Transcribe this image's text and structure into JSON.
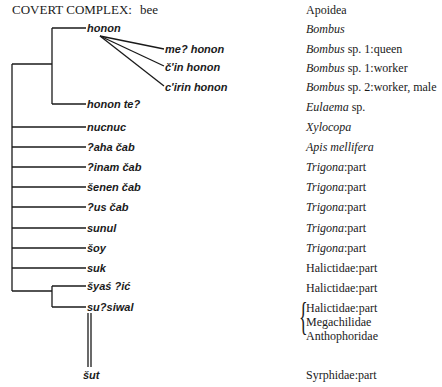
{
  "title": {
    "label": "COVERT COMPLEX:",
    "value": "bee",
    "right": "Apoidea"
  },
  "terms": [
    {
      "id": "honon",
      "label": "honon",
      "gloss_italic": "Bombus",
      "gloss": ""
    },
    {
      "id": "me-honon",
      "label": "me? honon",
      "gloss_italic": "Bombus",
      "gloss": " sp. 1:queen"
    },
    {
      "id": "cin-honon",
      "label": "č'in honon",
      "gloss_italic": "Bombus",
      "gloss": " sp. 1:worker"
    },
    {
      "id": "cirin-honon",
      "label": "c'irin honon",
      "gloss_italic": "Bombus",
      "gloss": " sp. 2:worker, male"
    },
    {
      "id": "honon-te",
      "label": "honon te?",
      "gloss_italic": "Eulaema",
      "gloss": " sp."
    },
    {
      "id": "nucnuc",
      "label": "nucnuc",
      "gloss_italic": "Xylocopa",
      "gloss": ""
    },
    {
      "id": "aha-cab",
      "label": "?aha čab",
      "gloss_italic": "Apis mellifera",
      "gloss": ""
    },
    {
      "id": "inam-cab",
      "label": "?inam čab",
      "gloss_italic": "Trigona",
      "gloss": ":part"
    },
    {
      "id": "senen-cab",
      "label": "šenen čab",
      "gloss_italic": "Trigona",
      "gloss": ":part"
    },
    {
      "id": "us-cab",
      "label": "?us čab",
      "gloss_italic": "Trigona",
      "gloss": ":part"
    },
    {
      "id": "sunul",
      "label": "sunul",
      "gloss_italic": "Trigona",
      "gloss": ":part"
    },
    {
      "id": "soy",
      "label": "šoy",
      "gloss_italic": "Trigona",
      "gloss": ":part"
    },
    {
      "id": "suk",
      "label": "suk",
      "gloss_italic": "",
      "gloss": "Halictidae:part"
    },
    {
      "id": "syas-ic",
      "label": "šyaś ?ić",
      "gloss_italic": "",
      "gloss": "Halictidae:part"
    },
    {
      "id": "susiwal",
      "label": "su?siwal",
      "gloss_italic": "",
      "gloss": "Halictidae:part",
      "gloss_extra": [
        "Megachilidae",
        "Anthophoridae"
      ]
    },
    {
      "id": "sut",
      "label": "šut",
      "gloss_italic": "",
      "gloss": "Syrphidae:part"
    }
  ]
}
